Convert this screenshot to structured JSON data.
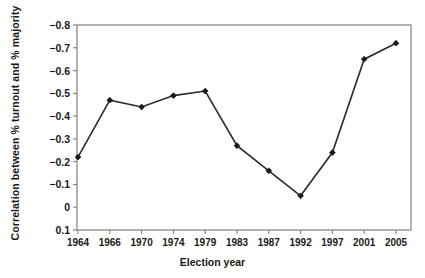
{
  "chart_data": {
    "type": "line",
    "title": "",
    "xlabel": "Election year",
    "ylabel": "Correlation between % turnout and % majority",
    "categories": [
      "1964",
      "1966",
      "1970",
      "1974",
      "1979",
      "1983",
      "1987",
      "1992",
      "1997",
      "2001",
      "2005"
    ],
    "values": [
      -0.22,
      -0.47,
      -0.44,
      -0.49,
      -0.51,
      -0.27,
      -0.16,
      -0.05,
      -0.24,
      -0.65,
      -0.72
    ],
    "series": [
      {
        "name": "Correlation",
        "values": [
          -0.22,
          -0.47,
          -0.44,
          -0.49,
          -0.51,
          -0.27,
          -0.16,
          -0.05,
          -0.24,
          -0.65,
          -0.72
        ]
      }
    ],
    "ylim": [
      0.1,
      -0.8
    ],
    "y_axis_inverted": true,
    "ytick_labels": [
      "−0.8",
      "−0.7",
      "−0.6",
      "−0.5",
      "−0.4",
      "−0.3",
      "−0.2",
      "−0.1",
      "0",
      "0.1"
    ],
    "ytick_values": [
      -0.8,
      -0.7,
      -0.6,
      -0.5,
      -0.4,
      -0.3,
      -0.2,
      -0.1,
      0,
      0.1
    ],
    "grid": false,
    "legend": "none",
    "marker": "diamond",
    "line_color": "#2b2b2b",
    "marker_color": "#1a1a1a",
    "axis_color": "#808080",
    "background": "#ffffff"
  }
}
